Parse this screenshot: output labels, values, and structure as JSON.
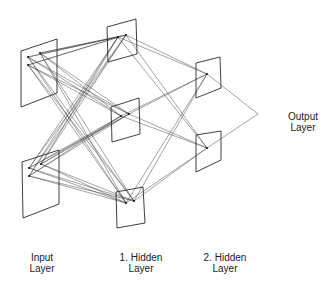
{
  "colors": {
    "line": "#333333",
    "panel": "#2a2a2a",
    "background": "#ffffff",
    "text": "#222222"
  },
  "layers": [
    {
      "id": "input",
      "line1": "Input",
      "line2": "Layer",
      "label_x": 42,
      "label_y": 252,
      "panels": [
        {
          "pts": [
            [
              21,
              51
            ],
            [
              57,
              39
            ],
            [
              57,
              93
            ],
            [
              21,
              107
            ]
          ],
          "nodes": [
            [
              28,
              57
            ],
            [
              40,
              53
            ],
            [
              28,
              65
            ]
          ]
        },
        {
          "pts": [
            [
              22,
              162
            ],
            [
              59,
              150
            ],
            [
              59,
              204
            ],
            [
              23,
              218
            ]
          ],
          "nodes": [
            [
              29,
              168
            ],
            [
              41,
              164
            ],
            [
              29,
              176
            ]
          ]
        }
      ]
    },
    {
      "id": "hidden1",
      "line1": "1. Hidden",
      "line2": "Layer",
      "label_x": 141,
      "label_y": 252,
      "panels": [
        {
          "pts": [
            [
              107,
              27
            ],
            [
              136,
              19
            ],
            [
              137,
              54
            ],
            [
              108,
              62
            ]
          ],
          "nodes": [
            [
              118,
              37
            ],
            [
              126,
              35
            ]
          ]
        },
        {
          "pts": [
            [
              111,
              107
            ],
            [
              139,
              98
            ],
            [
              140,
              134
            ],
            [
              112,
              142
            ]
          ],
          "nodes": [
            [
              121,
              116
            ],
            [
              129,
              114
            ]
          ]
        },
        {
          "pts": [
            [
              116,
              192
            ],
            [
              143,
              187
            ],
            [
              145,
              223
            ],
            [
              117,
              228
            ]
          ],
          "nodes": [
            [
              126,
              203
            ],
            [
              134,
              201
            ]
          ]
        }
      ]
    },
    {
      "id": "hidden2",
      "line1": "2. Hidden",
      "line2": "Layer",
      "label_x": 225,
      "label_y": 252,
      "panels": [
        {
          "pts": [
            [
              196,
              63
            ],
            [
              220,
              57
            ],
            [
              221,
              88
            ],
            [
              196,
              98
            ]
          ],
          "nodes": [
            [
              207,
              74
            ]
          ]
        },
        {
          "pts": [
            [
              196,
              135
            ],
            [
              221,
              131
            ],
            [
              221,
              160
            ],
            [
              196,
              172
            ]
          ],
          "nodes": [
            [
              207,
              148
            ]
          ]
        }
      ]
    },
    {
      "id": "output",
      "line1": "Output",
      "line2": "Layer",
      "label_x": 303,
      "label_y": 111,
      "panels": [],
      "nodes": [
        [
          258,
          114
        ]
      ]
    }
  ]
}
